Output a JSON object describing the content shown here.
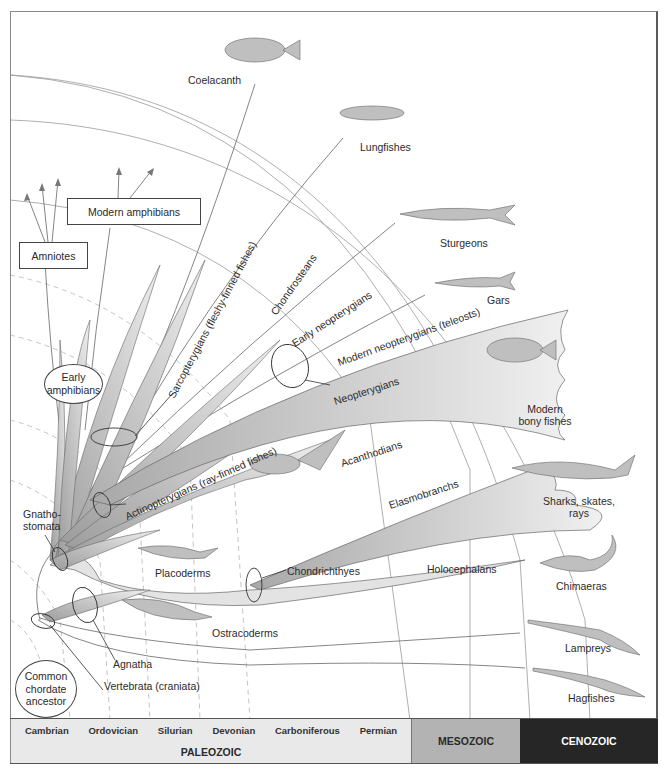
{
  "diagram": {
    "colors": {
      "frame": "#8a8a8a",
      "branch_fill": "#d4d4d4",
      "branch_stroke": "#555555",
      "time_arc": "#9a9a9a",
      "dashed_arc": "#b0b0b0",
      "paleozoic": "#e9e9e9",
      "mesozoic": "#b3b3b3",
      "cenozoic": "#262626"
    },
    "terminal_taxa": [
      {
        "id": "coelacanth",
        "label": "Coelacanth"
      },
      {
        "id": "lungfishes",
        "label": "Lungfishes"
      },
      {
        "id": "sturgeons",
        "label": "Sturgeons"
      },
      {
        "id": "gars",
        "label": "Gars"
      },
      {
        "id": "modern_bony_fishes",
        "label": "Modern bony fishes",
        "line1": "Modern",
        "line2": "bony fishes"
      },
      {
        "id": "sharks",
        "label": "Sharks, skates, rays",
        "line1": "Sharks, skates,",
        "line2": "rays"
      },
      {
        "id": "chimaeras",
        "label": "Chimaeras"
      },
      {
        "id": "lampreys",
        "label": "Lampreys"
      },
      {
        "id": "hagfishes",
        "label": "Hagfishes"
      }
    ],
    "boxes": {
      "modern_amphibians": "Modern amphibians",
      "amniotes": "Amniotes"
    },
    "ovals": {
      "early_amphibians": {
        "line1": "Early",
        "line2": "amphibians"
      },
      "common_ancestor": {
        "line1": "Common",
        "line2": "chordate",
        "line3": "ancestor"
      }
    },
    "clade_labels": {
      "sarcopterygians": "Sarcopterygians (fleshy-finned fishes)",
      "chondrosteans": "Chondrosteans",
      "early_neopterygians": "Early neopterygians",
      "modern_neopterygians": "Modern neopterygians (teleosts)",
      "neopterygians": "Neopterygians",
      "actinopterygians": "Actinopterygians (ray-finned fishes)",
      "acanthodians": "Acanthodians",
      "elasmobranchs": "Elasmobranchs",
      "gnathostomata_1": "Gnatho-",
      "gnathostomata_2": "stomata",
      "placoderms": "Placoderms",
      "chondrichthyes": "Chondrichthyes",
      "holocephalans": "Holocephalans",
      "ostracoderms": "Ostracoderms",
      "agnatha": "Agnatha",
      "vertebrata": "Vertebrata (craniata)"
    }
  },
  "timeline": {
    "eras": [
      {
        "id": "paleozoic",
        "label": "PALEOZOIC",
        "periods": [
          "Cambrian",
          "Ordovician",
          "Silurian",
          "Devonian",
          "Carboniferous",
          "Permian"
        ]
      },
      {
        "id": "mesozoic",
        "label": "MESOZOIC"
      },
      {
        "id": "cenozoic",
        "label": "CENOZOIC"
      }
    ]
  }
}
